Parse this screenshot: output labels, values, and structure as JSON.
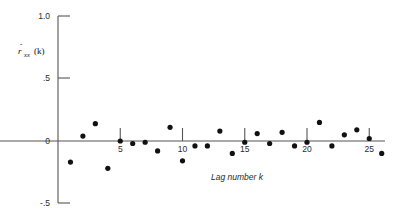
{
  "chart_data": {
    "type": "scatter",
    "title": "",
    "subtitle": "",
    "xlabel": "Lag number k",
    "ylabel": "r̂xx(k)",
    "ylabel_parts": {
      "base": "r",
      "hat": "ˆ",
      "sub": "xx",
      "arg": "(k)"
    },
    "xlim": [
      0,
      26.5
    ],
    "ylim": [
      -0.5,
      1.0
    ],
    "xticks": [
      5,
      10,
      15,
      20,
      25
    ],
    "xtick_labels": [
      "5",
      "10",
      "15",
      "20",
      "25"
    ],
    "yticks": [
      -0.5,
      0,
      0.5,
      1.0
    ],
    "ytick_labels": [
      "-.5",
      "0",
      ".5",
      "1.0"
    ],
    "grid": false,
    "legend": null,
    "x": [
      1,
      2,
      3,
      4,
      5,
      6,
      7,
      8,
      9,
      10,
      11,
      12,
      13,
      14,
      15,
      16,
      17,
      18,
      19,
      20,
      21,
      22,
      23,
      24,
      25,
      26
    ],
    "values": [
      -0.17,
      0.04,
      0.14,
      -0.22,
      0.0,
      -0.02,
      -0.01,
      -0.08,
      0.11,
      -0.16,
      -0.04,
      -0.04,
      0.08,
      -0.1,
      -0.01,
      0.06,
      -0.02,
      0.07,
      -0.04,
      -0.01,
      0.15,
      -0.04,
      0.05,
      0.09,
      0.02,
      -0.1
    ],
    "series": [
      {
        "name": "sample autocorrelation",
        "marker": "filled-circle",
        "color": "#111111",
        "points": [
          {
            "k": 1,
            "r": -0.17
          },
          {
            "k": 2,
            "r": 0.04
          },
          {
            "k": 3,
            "r": 0.14
          },
          {
            "k": 4,
            "r": -0.22
          },
          {
            "k": 5,
            "r": 0.0
          },
          {
            "k": 6,
            "r": -0.02
          },
          {
            "k": 7,
            "r": -0.01
          },
          {
            "k": 8,
            "r": -0.08
          },
          {
            "k": 9,
            "r": 0.11
          },
          {
            "k": 10,
            "r": -0.16
          },
          {
            "k": 11,
            "r": -0.04
          },
          {
            "k": 12,
            "r": -0.04
          },
          {
            "k": 13,
            "r": 0.08
          },
          {
            "k": 14,
            "r": -0.1
          },
          {
            "k": 15,
            "r": -0.01
          },
          {
            "k": 16,
            "r": 0.06
          },
          {
            "k": 17,
            "r": -0.02
          },
          {
            "k": 18,
            "r": 0.07
          },
          {
            "k": 19,
            "r": -0.04
          },
          {
            "k": 20,
            "r": -0.01
          },
          {
            "k": 21,
            "r": 0.15
          },
          {
            "k": 22,
            "r": -0.04
          },
          {
            "k": 23,
            "r": 0.05
          },
          {
            "k": 24,
            "r": 0.09
          },
          {
            "k": 25,
            "r": 0.02
          },
          {
            "k": 26,
            "r": -0.1
          }
        ]
      }
    ]
  }
}
